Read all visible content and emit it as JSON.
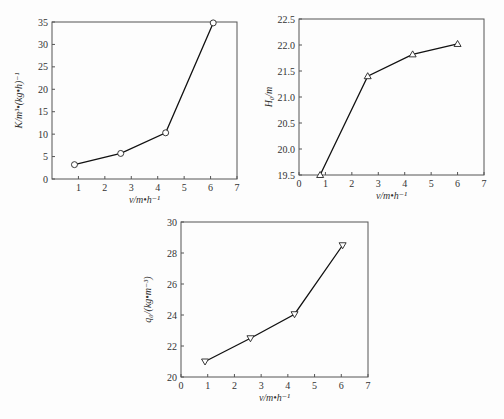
{
  "chart_data": [
    {
      "type": "line",
      "title": "",
      "xlabel": "v/m•h⁻¹",
      "ylabel": "K/m³•(kg•h)⁻¹",
      "marker": "circle",
      "x": [
        0.85,
        2.6,
        4.3,
        6.1
      ],
      "y": [
        3.2,
        5.7,
        10.3,
        34.8
      ],
      "xlim": [
        0,
        7
      ],
      "ylim": [
        0,
        35
      ],
      "xticks": [
        "1",
        "2",
        "3",
        "4",
        "5",
        "6",
        "7"
      ],
      "xzero_label": "",
      "yticks": [
        "0",
        "5",
        "10",
        "15",
        "20",
        "25",
        "30",
        "35"
      ],
      "grid": false
    },
    {
      "type": "line",
      "title": "",
      "xlabel": "v/m•h⁻¹",
      "ylabel": "H₀/m",
      "marker": "triangle-up",
      "x": [
        0.8,
        2.6,
        4.3,
        6.0
      ],
      "y": [
        19.5,
        21.4,
        21.82,
        22.02
      ],
      "xlim": [
        0,
        7
      ],
      "ylim": [
        19.5,
        22.5
      ],
      "xticks": [
        "0",
        "1",
        "2",
        "3",
        "4",
        "5",
        "6",
        "7"
      ],
      "yticks": [
        "19.5",
        "20.0",
        "20.5",
        "21.0",
        "21.5",
        "22.0",
        "22.5"
      ],
      "grid": false
    },
    {
      "type": "line",
      "title": "",
      "xlabel": "v/m•h⁻¹",
      "ylabel": "q₀/(kg•m⁻³)",
      "marker": "triangle-down",
      "x": [
        0.9,
        2.6,
        4.25,
        6.05
      ],
      "y": [
        21.0,
        22.5,
        24.05,
        28.5
      ],
      "xlim": [
        0,
        7
      ],
      "ylim": [
        20,
        30
      ],
      "xticks": [
        "0",
        "1",
        "2",
        "3",
        "4",
        "5",
        "6",
        "7"
      ],
      "yticks": [
        "20",
        "22",
        "24",
        "26",
        "28",
        "30"
      ],
      "grid": false
    }
  ],
  "charts": {
    "k": {
      "xlabel": "v/m•h⁻¹",
      "ylabel": "K/m³•(kg•h)⁻¹"
    },
    "h": {
      "xlabel": "v/m•h⁻¹",
      "ylabel": "H₀/m"
    },
    "q": {
      "xlabel": "v/m•h⁻¹",
      "ylabel": "q₀/(kg•m⁻³)"
    }
  }
}
